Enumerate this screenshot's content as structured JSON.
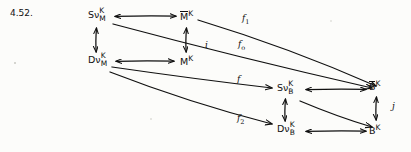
{
  "figure": {
    "number": "4.52.",
    "type": "commutative-diagram",
    "width": 411,
    "height": 152,
    "ink_color": "#101010",
    "paper_color": "#fcfcfa"
  },
  "nodes": [
    {
      "id": "SvKM",
      "base": "Sν",
      "sup": "K",
      "sub": "M",
      "bar": false,
      "x": 88,
      "y": 10
    },
    {
      "id": "MbarK",
      "base": "M",
      "sup": "K",
      "sub": "",
      "bar": true,
      "x": 180,
      "y": 10
    },
    {
      "id": "DvKM",
      "base": "Dν",
      "sup": "K",
      "sub": "M",
      "bar": false,
      "x": 88,
      "y": 55
    },
    {
      "id": "MK",
      "base": "M",
      "sup": "K",
      "sub": "",
      "bar": false,
      "x": 180,
      "y": 55
    },
    {
      "id": "SvKB",
      "base": "Sν",
      "sup": "K",
      "sub": "B",
      "bar": false,
      "x": 277,
      "y": 83
    },
    {
      "id": "BbarK",
      "base": "B",
      "sup": "K",
      "sub": "",
      "bar": true,
      "x": 369,
      "y": 80
    },
    {
      "id": "DvKB",
      "base": "Dν",
      "sup": "K",
      "sub": "B",
      "bar": false,
      "x": 277,
      "y": 124
    },
    {
      "id": "BK",
      "base": "B",
      "sup": "K",
      "sub": "",
      "bar": false,
      "x": 369,
      "y": 124
    }
  ],
  "edge_labels": [
    {
      "id": "f1",
      "text": "f",
      "subscript": "1",
      "x": 242,
      "y": 14
    },
    {
      "id": "f0",
      "text": "f",
      "subscript": "o",
      "x": 238,
      "y": 40
    },
    {
      "id": "i",
      "text": "i",
      "subscript": "",
      "x": 205,
      "y": 41
    },
    {
      "id": "f",
      "text": "f",
      "subscript": "",
      "x": 237,
      "y": 75
    },
    {
      "id": "f2",
      "text": "f",
      "subscript": "2",
      "x": 237,
      "y": 114
    },
    {
      "id": "j",
      "text": "j",
      "subscript": "",
      "x": 392,
      "y": 102
    }
  ],
  "arrows": {
    "horizontal_bidirectional": [
      {
        "from": "SvKM",
        "to": "MbarK",
        "y": 16
      },
      {
        "from": "DvKM",
        "to": "MK",
        "y": 61
      },
      {
        "from": "SvKB",
        "to": "BbarK",
        "y": 89
      },
      {
        "from": "DvKB",
        "to": "BK",
        "y": 131
      }
    ],
    "vertical_bidirectional": [
      {
        "from": "SvKM",
        "to": "DvKM",
        "x": 96
      },
      {
        "from": "MbarK",
        "to": "MK",
        "x": 186
      },
      {
        "from": "SvKB",
        "to": "DvKB",
        "x": 285
      },
      {
        "from": "BbarK",
        "to": "BK",
        "x": 376
      }
    ],
    "diagonals": [
      {
        "label": "f1",
        "from": "MbarK",
        "to": "BbarK"
      },
      {
        "label": "f0",
        "from": "SvKM",
        "to": "SvKB"
      },
      {
        "label": "f",
        "from": "DvKM",
        "to": "SvKB"
      },
      {
        "label": "f2",
        "from": "DvKM",
        "to": "DvKB"
      },
      {
        "label": "",
        "from": "SvKB",
        "to": "BK"
      }
    ]
  }
}
